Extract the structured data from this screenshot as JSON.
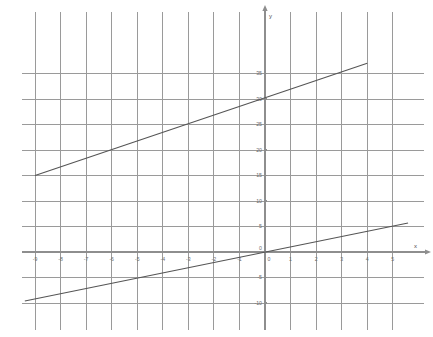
{
  "chart_data": {
    "type": "line",
    "title": "",
    "xlabel": "x",
    "ylabel": "y",
    "xlim": [
      -9.6,
      5.9
    ],
    "ylim": [
      -11.2,
      38.5
    ],
    "grid": true,
    "grid_x_step": 1,
    "grid_y_step": 5,
    "legend": "none",
    "background": "#ffffff",
    "grid_color": "#9a9a9a",
    "axis_color": "#8e8e8e",
    "line_color": "#555555",
    "x_ticks": [
      {
        "value": -9,
        "label": "-9"
      },
      {
        "value": -8,
        "label": "-8"
      },
      {
        "value": -7,
        "label": "-7"
      },
      {
        "value": -6,
        "label": "-6"
      },
      {
        "value": -5,
        "label": "-5"
      },
      {
        "value": -4,
        "label": "-4"
      },
      {
        "value": -3,
        "label": "-3"
      },
      {
        "value": -2,
        "label": "-2"
      },
      {
        "value": -1,
        "label": "-1"
      },
      {
        "value": 0,
        "label": "0"
      },
      {
        "value": 1,
        "label": "1"
      },
      {
        "value": 2,
        "label": "2"
      },
      {
        "value": 3,
        "label": "3"
      },
      {
        "value": 4,
        "label": "4"
      },
      {
        "value": 5,
        "label": "5"
      }
    ],
    "y_ticks": [
      {
        "value": 35,
        "label": "35"
      },
      {
        "value": 30,
        "label": "30"
      },
      {
        "value": 25,
        "label": "25"
      },
      {
        "value": 20,
        "label": "20"
      },
      {
        "value": 15,
        "label": "15"
      },
      {
        "value": 10,
        "label": "10"
      },
      {
        "value": 5,
        "label": "5"
      },
      {
        "value": 0,
        "label": "0"
      },
      {
        "value": -5,
        "label": "-5"
      },
      {
        "value": -10,
        "label": "-10"
      }
    ],
    "series": [
      {
        "name": "upper-line",
        "slope": 1.7,
        "intercept": 32,
        "points": [
          {
            "x": -9,
            "y": 15
          },
          {
            "x": 4,
            "y": 37
          }
        ]
      },
      {
        "name": "lower-line",
        "slope": 1,
        "intercept": 0,
        "points": [
          {
            "x": -9.4,
            "y": -9.6
          },
          {
            "x": 5.6,
            "y": 5.7
          }
        ]
      }
    ]
  },
  "axes": {
    "x_axis_label": "x",
    "y_axis_label": "y"
  }
}
